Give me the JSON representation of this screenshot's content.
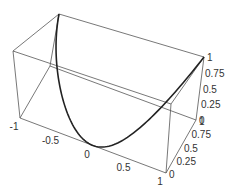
{
  "chart_data": {
    "type": "line3d",
    "title": "",
    "xlabel": "",
    "ylabel": "",
    "zlabel": "",
    "xlim": [
      -1,
      1
    ],
    "ylim": [
      0,
      1
    ],
    "zlim": [
      0,
      1
    ],
    "x_ticks": [
      "-1",
      "-0.5",
      "0",
      "0.5",
      "1"
    ],
    "y_ticks": [
      "0",
      "0.25",
      "0.5",
      "0.75",
      "1"
    ],
    "z_ticks": [
      "0",
      "0.25",
      "0.5",
      "0.75",
      "1"
    ],
    "series": [
      {
        "name": "curve",
        "description": "parametric curve x=t, y=t^2, z=t^2, t in [-1,1]",
        "x": [
          -1,
          -0.75,
          -0.5,
          -0.25,
          0,
          0.25,
          0.5,
          0.75,
          1
        ],
        "y": [
          1,
          0.5625,
          0.25,
          0.0625,
          0,
          0.0625,
          0.25,
          0.5625,
          1
        ],
        "z": [
          1,
          0.5625,
          0.25,
          0.0625,
          0,
          0.0625,
          0.25,
          0.5625,
          1
        ]
      }
    ],
    "box": true,
    "grid": false,
    "legend": null
  },
  "colors": {
    "box": "#555555",
    "curve": "#222222",
    "text": "#333333"
  },
  "corners": {
    "fbl": [
      20,
      118
    ],
    "fbr": [
      166,
      173
    ],
    "bbr": [
      196,
      120
    ],
    "bbl": [
      50,
      66
    ],
    "ftl": [
      13,
      51
    ],
    "ftr": [
      171,
      104
    ],
    "btr": [
      204,
      57
    ],
    "btl": [
      59,
      14
    ]
  }
}
